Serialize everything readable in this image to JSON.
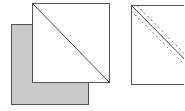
{
  "diagram": {
    "colors": {
      "stroke": "#555555",
      "gray_fill": "#c8c8c8",
      "white_fill": "#ffffff",
      "dash": "#777777"
    },
    "left_figure": {
      "back_square": {
        "x": 11,
        "y": 24,
        "w": 77,
        "h": 80,
        "fill": "gray"
      },
      "front_square": {
        "x": 32,
        "y": 3,
        "w": 77,
        "h": 79,
        "fill": "white"
      },
      "diagonal": "top-left to bottom-right"
    },
    "right_figure": {
      "square": {
        "x": 131,
        "y": 5,
        "w": 78,
        "h": 79,
        "fill": "white"
      },
      "diagonal": "top-left to bottom-right",
      "dashed_parallels": 2
    }
  }
}
